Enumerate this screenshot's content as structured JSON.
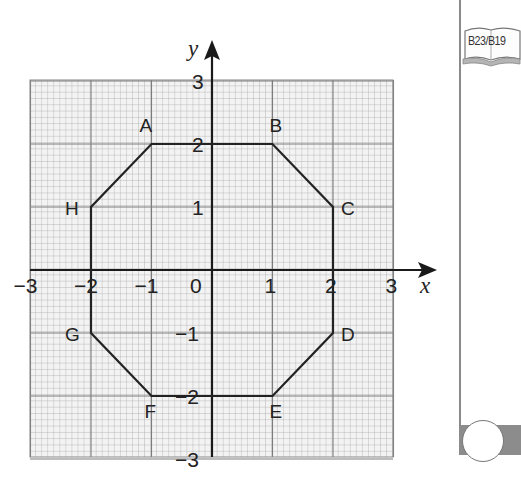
{
  "diagram": {
    "axes": {
      "x_label": "x",
      "y_label": "y",
      "x_ticks": [
        "−3",
        "−2",
        "−1",
        "0",
        "1",
        "2",
        "3"
      ],
      "y_ticks_positive": [
        "3",
        "2",
        "1"
      ],
      "y_ticks_negative": [
        "−1",
        "−2",
        "−3"
      ],
      "x_range": [
        -3,
        3
      ],
      "y_range": [
        -3,
        3
      ]
    },
    "grid": {
      "minor_per_unit": 10,
      "line_color": "#9a9a9a",
      "major_color": "#7a7a7a",
      "background": "#f2f2f2"
    },
    "octagon": {
      "stroke": "#222222",
      "vertices": [
        {
          "label": "A",
          "x": -1,
          "y": 2
        },
        {
          "label": "B",
          "x": 1,
          "y": 2
        },
        {
          "label": "C",
          "x": 2,
          "y": 1
        },
        {
          "label": "D",
          "x": 2,
          "y": -1
        },
        {
          "label": "E",
          "x": 1,
          "y": -2
        },
        {
          "label": "F",
          "x": -1,
          "y": -2
        },
        {
          "label": "G",
          "x": -2,
          "y": -1
        },
        {
          "label": "H",
          "x": -2,
          "y": 1
        }
      ]
    }
  },
  "sidebar": {
    "reference_badge": "B23/B19",
    "band_color": "#8c8c8c"
  }
}
